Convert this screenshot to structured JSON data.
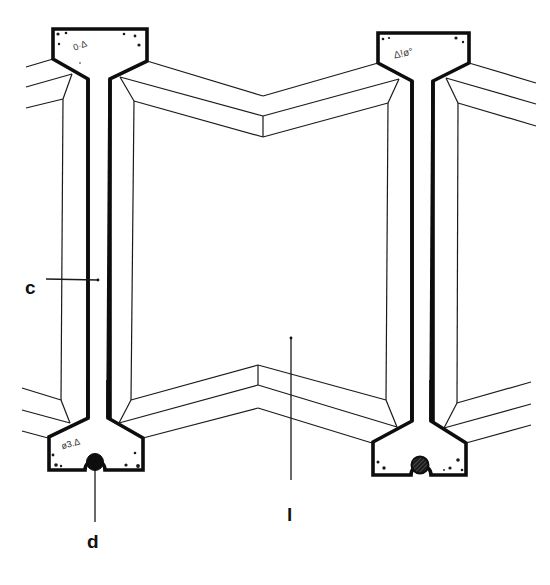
{
  "diagram": {
    "type": "technical-section-drawing",
    "labels": {
      "c": "c",
      "d": "d",
      "l": "l"
    },
    "components": [
      {
        "id": "left-column",
        "description": "precast concrete column with T-shaped top and bottom flanges"
      },
      {
        "id": "right-column",
        "description": "precast concrete column with T-shaped top and bottom flanges"
      },
      {
        "id": "center-panel",
        "description": "folded V-shaped infill panel between columns"
      },
      {
        "id": "left-groove",
        "description": "circular groove/joint at base of left column (solid)"
      },
      {
        "id": "right-groove",
        "description": "circular groove/joint at base of right column (hatched)"
      }
    ],
    "colors": {
      "line": "#0d0d0d",
      "background": "#ffffff"
    }
  }
}
